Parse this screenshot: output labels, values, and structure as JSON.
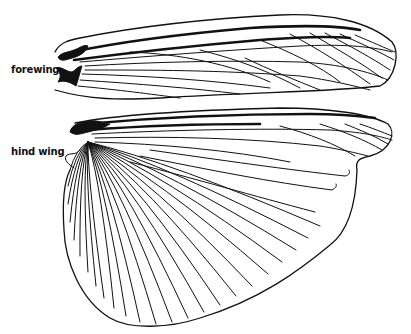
{
  "figure": {
    "labels": {
      "forewing": "forewing",
      "hind_wing": "hind wing"
    },
    "colors": {
      "line": "#111111",
      "background": "#ffffff"
    }
  }
}
